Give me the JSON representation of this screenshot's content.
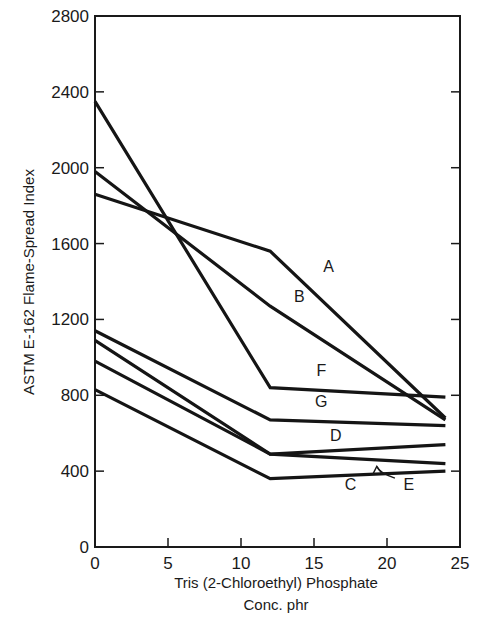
{
  "chart_data": {
    "type": "line",
    "title": "",
    "xlabel": "Tris (2-Chloroethyl) Phosphate",
    "xlabel_line2": "Conc. phr",
    "ylabel": "ASTM E-162 Flame-Spread Index",
    "xlim": [
      0,
      25
    ],
    "ylim": [
      0,
      2800
    ],
    "xticks": [
      0,
      5,
      10,
      15,
      20,
      25
    ],
    "yticks": [
      0,
      400,
      800,
      1200,
      1600,
      2000,
      2400,
      2800
    ],
    "grid": false,
    "legend": "inline labels",
    "x": [
      0,
      12,
      24
    ],
    "series": [
      {
        "name": "A",
        "values": [
          1860,
          1560,
          680
        ]
      },
      {
        "name": "B",
        "values": [
          1980,
          1270,
          670
        ]
      },
      {
        "name": "F",
        "values": [
          2350,
          840,
          790
        ]
      },
      {
        "name": "G",
        "values": [
          1140,
          670,
          640
        ]
      },
      {
        "name": "D",
        "values": [
          1090,
          490,
          540
        ]
      },
      {
        "name": "E",
        "values": [
          980,
          490,
          440
        ]
      },
      {
        "name": "C",
        "values": [
          830,
          360,
          400
        ]
      }
    ],
    "annotations": [
      {
        "text": "A",
        "x": 16,
        "y": 1450
      },
      {
        "text": "B",
        "x": 14,
        "y": 1290
      },
      {
        "text": "F",
        "x": 15.5,
        "y": 900
      },
      {
        "text": "G",
        "x": 15.5,
        "y": 740
      },
      {
        "text": "D",
        "x": 16.5,
        "y": 560
      },
      {
        "text": "C",
        "x": 17.5,
        "y": 300
      },
      {
        "text": "E",
        "x": 21.5,
        "y": 300,
        "arrow_to": {
          "x": 19.3,
          "y": 425
        }
      }
    ]
  },
  "labels": {
    "ytitle": "ASTM E-162 Flame-Spread Index",
    "xtitle1": "Tris (2-Chloroethyl) Phosphate",
    "xtitle2": "Conc. phr"
  }
}
